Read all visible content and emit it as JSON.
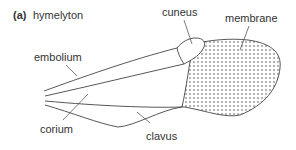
{
  "figure": {
    "panel_letter": "(a)",
    "title": "hymelyton",
    "labels": {
      "cuneus": "cuneus",
      "membrane": "membrane",
      "embolium": "embolium",
      "corium": "corium",
      "clavus": "clavus"
    },
    "colors": {
      "line": "#444444",
      "dots": "#555555",
      "text": "#333333"
    }
  }
}
